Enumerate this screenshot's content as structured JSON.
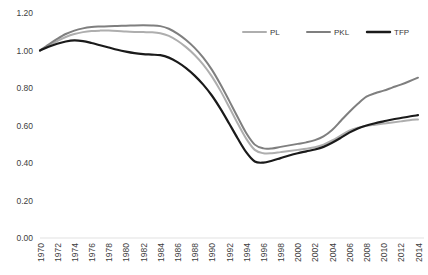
{
  "chart_data": {
    "type": "line",
    "title": "",
    "subtitle": "",
    "xlabel": "",
    "ylabel": "",
    "grid": false,
    "legend_position": "top-right",
    "ylim": [
      0.0,
      1.2
    ],
    "ytick_labels": [
      "0.00",
      "0.20",
      "0.40",
      "0.60",
      "0.80",
      "1.00",
      "1.20"
    ],
    "ytick_values": [
      0.0,
      0.2,
      0.4,
      0.6,
      0.8,
      1.0,
      1.2
    ],
    "xtick_labels": [
      "1970",
      "1972",
      "1974",
      "1976",
      "1978",
      "1980",
      "1982",
      "1984",
      "1986",
      "1988",
      "1990",
      "1992",
      "1994",
      "1996",
      "1998",
      "2000",
      "2002",
      "2004",
      "2006",
      "2008",
      "2010",
      "2012",
      "2014"
    ],
    "x": [
      1970,
      1971,
      1972,
      1973,
      1974,
      1975,
      1976,
      1977,
      1978,
      1979,
      1980,
      1981,
      1982,
      1983,
      1984,
      1985,
      1986,
      1987,
      1988,
      1989,
      1990,
      1991,
      1992,
      1993,
      1994,
      1995,
      1996,
      1997,
      1998,
      1999,
      2000,
      2001,
      2002,
      2003,
      2004,
      2005,
      2006,
      2007,
      2008,
      2009,
      2010,
      2011,
      2012,
      2013,
      2014
    ],
    "series": [
      {
        "name": "PL",
        "color": "#aeaeae",
        "width": 2.0,
        "values": [
          1.0,
          1.025,
          1.05,
          1.072,
          1.088,
          1.098,
          1.104,
          1.106,
          1.106,
          1.104,
          1.101,
          1.099,
          1.098,
          1.097,
          1.092,
          1.078,
          1.052,
          1.018,
          0.976,
          0.925,
          0.862,
          0.786,
          0.7,
          0.612,
          0.53,
          0.47,
          0.452,
          0.452,
          0.458,
          0.464,
          0.47,
          0.476,
          0.484,
          0.498,
          0.52,
          0.546,
          0.572,
          0.588,
          0.598,
          0.604,
          0.61,
          0.616,
          0.622,
          0.628,
          0.632
        ]
      },
      {
        "name": "PKL",
        "color": "#7f7f7f",
        "width": 2.0,
        "values": [
          1.0,
          1.032,
          1.062,
          1.088,
          1.106,
          1.118,
          1.125,
          1.128,
          1.13,
          1.131,
          1.132,
          1.134,
          1.135,
          1.134,
          1.13,
          1.116,
          1.09,
          1.056,
          1.014,
          0.962,
          0.898,
          0.82,
          0.734,
          0.645,
          0.56,
          0.498,
          0.478,
          0.478,
          0.486,
          0.494,
          0.502,
          0.51,
          0.522,
          0.542,
          0.576,
          0.624,
          0.672,
          0.716,
          0.754,
          0.772,
          0.786,
          0.802,
          0.818,
          0.836,
          0.855
        ]
      },
      {
        "name": "TFP",
        "color": "#1a1a1a",
        "width": 2.2,
        "values": [
          1.0,
          1.02,
          1.036,
          1.048,
          1.054,
          1.05,
          1.04,
          1.028,
          1.016,
          1.004,
          0.994,
          0.986,
          0.981,
          0.978,
          0.975,
          0.962,
          0.938,
          0.906,
          0.866,
          0.818,
          0.76,
          0.69,
          0.612,
          0.532,
          0.458,
          0.408,
          0.402,
          0.412,
          0.426,
          0.44,
          0.452,
          0.462,
          0.472,
          0.486,
          0.508,
          0.534,
          0.562,
          0.584,
          0.6,
          0.612,
          0.622,
          0.632,
          0.64,
          0.648,
          0.655
        ]
      }
    ]
  },
  "legend": {
    "items": [
      {
        "label": "PL",
        "color": "#aeaeae"
      },
      {
        "label": "PKL",
        "color": "#7f7f7f"
      },
      {
        "label": "TFP",
        "color": "#1a1a1a"
      }
    ]
  }
}
